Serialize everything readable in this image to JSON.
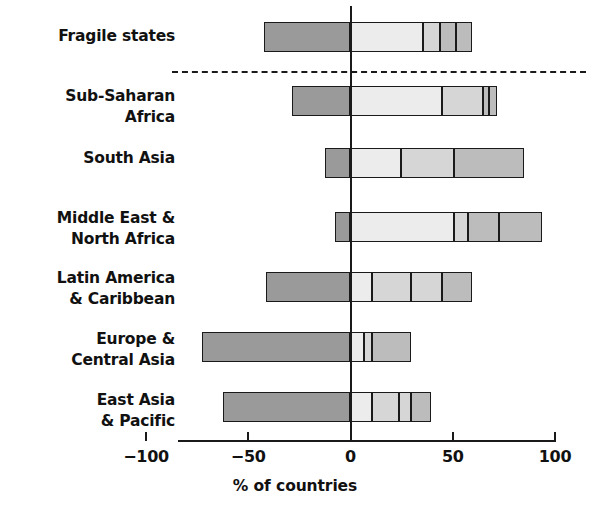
{
  "chart_data": {
    "type": "bar",
    "orientation": "horizontal",
    "stacked": true,
    "diverging": true,
    "title": "",
    "subtitle": "",
    "xlabel": "% of countries",
    "ylabel": "",
    "xlim": [
      -100,
      100
    ],
    "xticks": [
      -100,
      -50,
      0,
      50,
      100
    ],
    "xtick_labels": [
      "−100",
      "−50",
      "0",
      "50",
      "100"
    ],
    "grid": false,
    "legend": null,
    "annotations": [
      {
        "type": "dashed-separator",
        "after_category": "Fragile states"
      }
    ],
    "categories": [
      "Fragile states",
      "Sub-Saharan\nAfrica",
      "South Asia",
      "Middle East &\nNorth Africa",
      "Latin America\n& Caribbean",
      "Europe &\nCentral Asia",
      "East Asia\n& Pacific"
    ],
    "colors": {
      "dark": "#9a9a9a",
      "light": "#ececec",
      "mid_light": "#d6d6d6",
      "mid": "#bcbcbc",
      "outline": "#1a1a1a"
    },
    "bars": [
      {
        "category": "Fragile states",
        "negative_total": -42,
        "positive_total": 51,
        "segments": [
          {
            "start": -42,
            "end": 0,
            "shade": "dark"
          },
          {
            "start": 0,
            "end": 36,
            "shade": "light"
          },
          {
            "start": 36,
            "end": 44,
            "shade": "mid_light"
          },
          {
            "start": 44,
            "end": 52,
            "shade": "mid"
          },
          {
            "start": 52,
            "end": 60,
            "shade": "mid"
          }
        ]
      },
      {
        "category": "Sub-Saharan Africa",
        "negative_total": -28,
        "positive_total": 72,
        "segments": [
          {
            "start": -28,
            "end": 0,
            "shade": "dark"
          },
          {
            "start": 0,
            "end": 45,
            "shade": "light"
          },
          {
            "start": 45,
            "end": 65,
            "shade": "mid_light"
          },
          {
            "start": 65,
            "end": 68,
            "shade": "mid"
          },
          {
            "start": 68,
            "end": 72,
            "shade": "mid"
          }
        ]
      },
      {
        "category": "South Asia",
        "negative_total": -12,
        "positive_total": 85,
        "segments": [
          {
            "start": -12,
            "end": 0,
            "shade": "dark"
          },
          {
            "start": 0,
            "end": 25,
            "shade": "light"
          },
          {
            "start": 25,
            "end": 51,
            "shade": "mid_light"
          },
          {
            "start": 51,
            "end": 85,
            "shade": "mid"
          }
        ]
      },
      {
        "category": "Middle East & North Africa",
        "negative_total": -7,
        "positive_total": 94,
        "segments": [
          {
            "start": -7,
            "end": 0,
            "shade": "dark"
          },
          {
            "start": 0,
            "end": 51,
            "shade": "light"
          },
          {
            "start": 51,
            "end": 58,
            "shade": "mid_light"
          },
          {
            "start": 58,
            "end": 73,
            "shade": "mid"
          },
          {
            "start": 73,
            "end": 94,
            "shade": "mid"
          }
        ]
      },
      {
        "category": "Latin America & Caribbean",
        "negative_total": -41,
        "positive_total": 60,
        "segments": [
          {
            "start": -41,
            "end": 0,
            "shade": "dark"
          },
          {
            "start": 0,
            "end": 11,
            "shade": "light"
          },
          {
            "start": 11,
            "end": 30,
            "shade": "mid_light"
          },
          {
            "start": 30,
            "end": 45,
            "shade": "mid_light"
          },
          {
            "start": 45,
            "end": 60,
            "shade": "mid"
          }
        ]
      },
      {
        "category": "Europe & Central Asia",
        "negative_total": -72,
        "positive_total": 30,
        "segments": [
          {
            "start": -72,
            "end": 0,
            "shade": "dark"
          },
          {
            "start": 0,
            "end": 7,
            "shade": "light"
          },
          {
            "start": 7,
            "end": 11,
            "shade": "mid_light"
          },
          {
            "start": 11,
            "end": 30,
            "shade": "mid"
          }
        ]
      },
      {
        "category": "East Asia & Pacific",
        "negative_total": -62,
        "positive_total": 40,
        "segments": [
          {
            "start": -62,
            "end": 0,
            "shade": "dark"
          },
          {
            "start": 0,
            "end": 11,
            "shade": "light"
          },
          {
            "start": 11,
            "end": 24,
            "shade": "mid_light"
          },
          {
            "start": 24,
            "end": 30,
            "shade": "mid_light"
          },
          {
            "start": 30,
            "end": 40,
            "shade": "mid"
          }
        ]
      }
    ]
  },
  "axis": {
    "x_title": "% of countries",
    "tick_labels": [
      "−100",
      "−50",
      "0",
      "50",
      "100"
    ]
  },
  "categories": {
    "fragile_states": "Fragile states",
    "sub_saharan_africa_l1": "Sub-Saharan",
    "sub_saharan_africa_l2": "Africa",
    "south_asia": "South Asia",
    "mena_l1": "Middle East &",
    "mena_l2": "North Africa",
    "lac_l1": "Latin America",
    "lac_l2": "& Caribbean",
    "eca_l1": "Europe &",
    "eca_l2": "Central Asia",
    "eap_l1": "East Asia",
    "eap_l2": "& Pacific"
  }
}
